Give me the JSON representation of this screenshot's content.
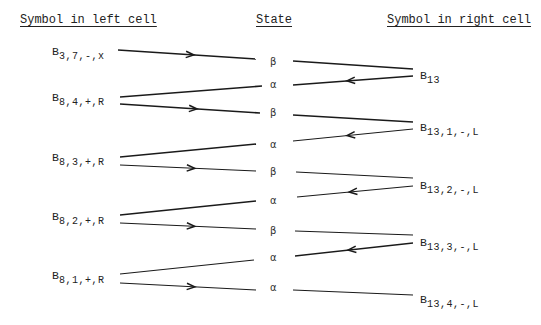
{
  "headers": {
    "left": "Symbol in left cell",
    "middle": "State",
    "right": "Symbol in right cell"
  },
  "left_symbols": [
    {
      "base": "B",
      "sub": "3,7,-,x",
      "x": 52,
      "y": 45
    },
    {
      "base": "B",
      "sub": "8,4,+,R",
      "x": 52,
      "y": 91
    },
    {
      "base": "B",
      "sub": "8,3,+,R",
      "x": 52,
      "y": 151
    },
    {
      "base": "B",
      "sub": "8,2,+,R",
      "x": 52,
      "y": 210
    },
    {
      "base": "B",
      "sub": "8,1,+,R",
      "x": 52,
      "y": 269
    }
  ],
  "states": [
    {
      "label": "β",
      "y": 56
    },
    {
      "label": "α",
      "y": 79
    },
    {
      "label": "β",
      "y": 107
    },
    {
      "label": "α",
      "y": 139
    },
    {
      "label": "β",
      "y": 166
    },
    {
      "label": "α",
      "y": 195
    },
    {
      "label": "β",
      "y": 225
    },
    {
      "label": "α",
      "y": 252
    },
    {
      "label": "α",
      "y": 282
    }
  ],
  "right_symbols": [
    {
      "base": "B",
      "sub": "13",
      "x": 420,
      "y": 69
    },
    {
      "base": "B",
      "sub": "13,1,-,L",
      "x": 420,
      "y": 121
    },
    {
      "base": "B",
      "sub": "13,2,-,L",
      "x": 420,
      "y": 179
    },
    {
      "base": "B",
      "sub": "13,3,-,L",
      "x": 420,
      "y": 236
    },
    {
      "base": "B",
      "sub": "13,4,-,L",
      "x": 420,
      "y": 293
    }
  ],
  "arrows": [
    {
      "from": [
        118,
        50
      ],
      "to": [
        256,
        59
      ],
      "dir": "right",
      "w": 1.4
    },
    {
      "from": [
        120,
        97
      ],
      "to": [
        262,
        86
      ],
      "dir": "none",
      "w": 1.6
    },
    {
      "from": [
        120,
        104
      ],
      "to": [
        260,
        113
      ],
      "dir": "right",
      "w": 1.6
    },
    {
      "from": [
        120,
        157
      ],
      "to": [
        256,
        144
      ],
      "dir": "none",
      "w": 1.3
    },
    {
      "from": [
        120,
        165
      ],
      "to": [
        256,
        171
      ],
      "dir": "right",
      "w": 1.2
    },
    {
      "from": [
        120,
        215
      ],
      "to": [
        256,
        201
      ],
      "dir": "none",
      "w": 1.6
    },
    {
      "from": [
        120,
        223
      ],
      "to": [
        256,
        229
      ],
      "dir": "right",
      "w": 1.2
    },
    {
      "from": [
        120,
        274
      ],
      "to": [
        254,
        260
      ],
      "dir": "none",
      "w": 1.2
    },
    {
      "from": [
        120,
        283
      ],
      "to": [
        256,
        290
      ],
      "dir": "right",
      "w": 1.2
    },
    {
      "from": [
        293,
        61
      ],
      "to": [
        413,
        69
      ],
      "dir": "none",
      "w": 1.6
    },
    {
      "from": [
        413,
        76
      ],
      "to": [
        293,
        85
      ],
      "dir": "left",
      "w": 1.5
    },
    {
      "from": [
        293,
        115
      ],
      "to": [
        413,
        122
      ],
      "dir": "none",
      "w": 1.3
    },
    {
      "from": [
        413,
        129
      ],
      "to": [
        293,
        141
      ],
      "dir": "left",
      "w": 1.0
    },
    {
      "from": [
        296,
        172
      ],
      "to": [
        413,
        178
      ],
      "dir": "none",
      "w": 1.1
    },
    {
      "from": [
        413,
        186
      ],
      "to": [
        297,
        197
      ],
      "dir": "left",
      "w": 1.2
    },
    {
      "from": [
        295,
        231
      ],
      "to": [
        413,
        235
      ],
      "dir": "none",
      "w": 1.1
    },
    {
      "from": [
        413,
        243
      ],
      "to": [
        295,
        256
      ],
      "dir": "left",
      "w": 1.4
    },
    {
      "from": [
        293,
        290
      ],
      "to": [
        413,
        295
      ],
      "dir": "none",
      "w": 1.1
    }
  ]
}
